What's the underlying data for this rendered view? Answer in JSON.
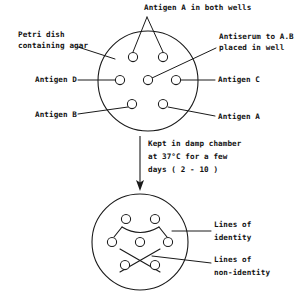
{
  "diagram": {
    "stroke_color": "#1a1a1a",
    "background_color": "#ffffff",
    "labels": {
      "antigen_a_both_wells": "Antigen A in both wells",
      "petri_dish_line1": "Petri dish",
      "petri_dish_line2": "containing agar",
      "antiserum_line1": "Antiserum to A.B.",
      "antiserum_line2": "placed in well",
      "antigen_d": "Antigen D",
      "antigen_c": "Antigen C",
      "antigen_b": "Antigen B",
      "antigen_a": "Antigen A",
      "incubation_line1": "Kept in damp chamber",
      "incubation_line2": "at 37°C for a few",
      "incubation_line3": "days ( 2 - 10 )",
      "lines_identity_line1": "Lines of",
      "lines_identity_line2": "identity",
      "lines_nonidentity_line1": "Lines of",
      "lines_nonidentity_line2": "non-identity"
    },
    "top_dish": {
      "name": "petri-dish-top",
      "center_x": 148,
      "center_y": 81,
      "radius": 50,
      "wells": [
        {
          "name": "well-antigen-a-top-left",
          "x": 133,
          "y": 57,
          "r": 4.6
        },
        {
          "name": "well-antigen-a-top-right",
          "x": 163,
          "y": 57,
          "r": 4.6
        },
        {
          "name": "well-antigen-d",
          "x": 120,
          "y": 80,
          "r": 4.6
        },
        {
          "name": "well-antiserum-center",
          "x": 148,
          "y": 80,
          "r": 4.6
        },
        {
          "name": "well-antigen-c",
          "x": 176,
          "y": 80,
          "r": 4.6
        },
        {
          "name": "well-antigen-b",
          "x": 132,
          "y": 104,
          "r": 4.6
        },
        {
          "name": "well-antigen-a-bottom",
          "x": 163,
          "y": 104,
          "r": 4.6
        }
      ]
    },
    "bottom_dish": {
      "name": "petri-dish-bottom",
      "center_x": 140,
      "center_y": 242,
      "radius": 48,
      "wells": [
        {
          "name": "result-well-top-left",
          "x": 126,
          "y": 219,
          "r": 4.6
        },
        {
          "name": "result-well-top-right",
          "x": 155,
          "y": 219,
          "r": 4.6
        },
        {
          "name": "result-well-left",
          "x": 112,
          "y": 242,
          "r": 4.6
        },
        {
          "name": "result-well-center",
          "x": 140,
          "y": 242,
          "r": 4.6
        },
        {
          "name": "result-well-right",
          "x": 168,
          "y": 242,
          "r": 4.6
        },
        {
          "name": "result-well-bottom-left",
          "x": 125,
          "y": 265,
          "r": 4.6
        },
        {
          "name": "result-well-bottom-right",
          "x": 155,
          "y": 265,
          "r": 4.6
        }
      ]
    },
    "incubation_arrow": {
      "name": "incubation-arrow",
      "x": 140,
      "y_start": 136,
      "y_end": 190
    }
  }
}
